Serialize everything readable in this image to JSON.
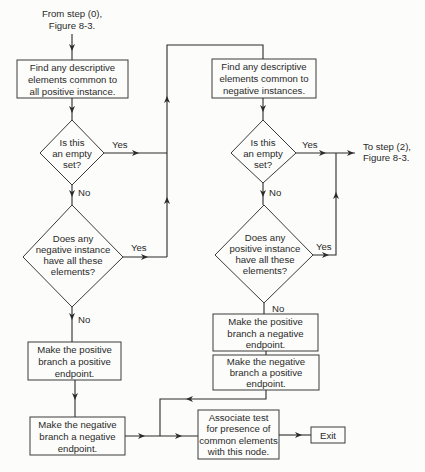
{
  "diagram": {
    "start_label": [
      "From step (0),",
      "Figure 8-3."
    ],
    "end_label": [
      "To step (2),",
      "Figure 8-3."
    ],
    "nodes": {
      "find_positive": [
        "Find any descriptive",
        "elements common to",
        "all positive instance."
      ],
      "empty_set_left": [
        "Is this",
        "an empty",
        "set?"
      ],
      "negative_has_all": [
        "Does any",
        "negative instance",
        "have all these",
        "elements?"
      ],
      "pos_branch_pos_endpoint": [
        "Make the positive",
        "branch a positive",
        "endpoint."
      ],
      "neg_branch_neg_endpoint": [
        "Make the negative",
        "branch a negative",
        "endpoint."
      ],
      "find_negative": [
        "Find any descriptive",
        "elements common to",
        "negative instances."
      ],
      "empty_set_right": [
        "Is this",
        "an empty",
        "set?"
      ],
      "positive_has_all": [
        "Does any",
        "positive instance",
        "have all these",
        "elements?"
      ],
      "pos_branch_neg_endpoint": [
        "Make the positive",
        "branch a negative",
        "endpoint."
      ],
      "neg_branch_pos_endpoint": [
        "Make the negative",
        "branch a positive",
        "endpoint."
      ],
      "associate_test": [
        "Associate test",
        "for presence of",
        "common elements",
        "with this node."
      ],
      "exit": "Exit"
    },
    "edge_labels": {
      "yes": "Yes",
      "no": "No"
    }
  }
}
